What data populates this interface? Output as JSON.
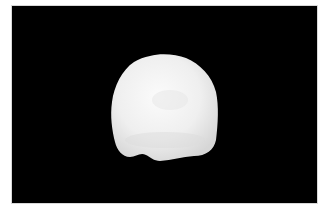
{
  "image": {
    "description": "Photograph of a single white tooth crown on a black background",
    "background_color": "#000000",
    "border_color": "#d8d8d8",
    "subject": {
      "label": "tooth crown",
      "color": "#f2f2f2",
      "shadow_color": "#cfcfcf"
    }
  }
}
